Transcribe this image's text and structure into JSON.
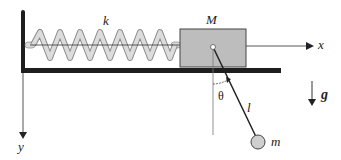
{
  "diagram": {
    "labels": {
      "spring_constant": "k",
      "block_mass": "M",
      "x_axis": "x",
      "y_axis": "y",
      "angle": "θ",
      "length": "l",
      "bob_mass": "m",
      "gravity": "g"
    },
    "colors": {
      "wall": "#1e1e1e",
      "block_fill": "#bdbdbd",
      "spring_fill": "#d9d9d9",
      "spring_stroke": "#8a8a8a",
      "bob_fill": "#cfcfcf",
      "line": "#444444"
    }
  }
}
